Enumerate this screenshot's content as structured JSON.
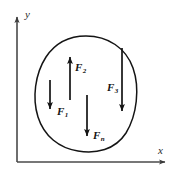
{
  "figure": {
    "kind": "free-body-diagram",
    "background_color": "#ffffff",
    "ink_color": "#141414",
    "axis_color": "#4a4a4a"
  },
  "axes": {
    "x_label": "x",
    "y_label": "y",
    "origin": {
      "x": 17,
      "y": 162
    },
    "x_end": {
      "x": 168,
      "y": 162
    },
    "y_end": {
      "x": 17,
      "y": 14
    },
    "arrowheads": [
      "x-positive",
      "y-positive"
    ]
  },
  "region": {
    "name": "closed-body-outline",
    "shape": "irregular-closed-curve",
    "bounds": {
      "left": 36,
      "top": 36,
      "right": 136,
      "bottom": 152
    }
  },
  "vectors": [
    {
      "id": "F1",
      "label": "F",
      "subscript": "1",
      "direction": "down",
      "x": 50,
      "y_start": 80,
      "y_end": 113,
      "length": 33,
      "label_side": "right"
    },
    {
      "id": "F2",
      "label": "F",
      "subscript": "2",
      "direction": "up",
      "x": 70,
      "y_start": 100,
      "y_end": 53,
      "length": 47,
      "label_side": "right"
    },
    {
      "id": "F3",
      "label": "F",
      "subscript": "3",
      "direction": "down",
      "x": 122,
      "y_start": 48,
      "y_end": 115,
      "length": 67,
      "label_side": "left"
    },
    {
      "id": "Fn",
      "label": "F",
      "subscript": "n",
      "direction": "down",
      "x": 87,
      "y_start": 95,
      "y_end": 140,
      "length": 45,
      "label_side": "right"
    }
  ]
}
